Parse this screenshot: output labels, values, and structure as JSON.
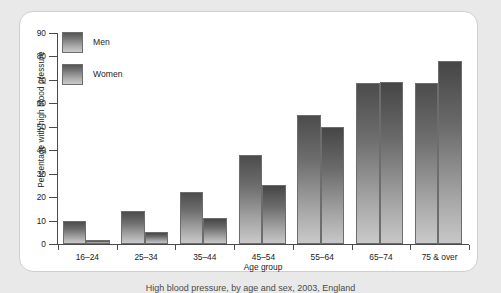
{
  "chart_data": {
    "type": "bar",
    "title": "",
    "xlabel": "Age group",
    "ylabel": "Percentage with high blood pressure",
    "categories": [
      "16–24",
      "25–34",
      "35–44",
      "45–54",
      "55–64",
      "65–74",
      "75 & over"
    ],
    "series": [
      {
        "name": "Men",
        "values": [
          10,
          14,
          22,
          38,
          55,
          68.5,
          68.5
        ]
      },
      {
        "name": "Women",
        "values": [
          1.5,
          5,
          11,
          25,
          50,
          69,
          78
        ]
      }
    ],
    "ylim": [
      0,
      90
    ],
    "yticks": [
      0,
      10,
      20,
      30,
      40,
      50,
      60,
      70,
      80,
      90
    ],
    "ytick_labels": [
      "0",
      "10",
      "20",
      "30",
      "40",
      "50",
      "60",
      "70",
      "80",
      "90"
    ],
    "grid": false,
    "legend_position": "top-left",
    "colors": {
      "men_bar_top": "#4c4c4c",
      "men_bar_bottom": "#c9c9c9",
      "women_bar_top": "#464646",
      "women_bar_bottom": "#c7c7c7",
      "bar_outline": "#6d6d6d",
      "axis": "#4a4a4a",
      "panel_background": "#ffffff",
      "page_background": "#e9e9e9"
    }
  },
  "legend": {
    "items": [
      {
        "label": "Men"
      },
      {
        "label": "Women"
      }
    ]
  },
  "caption": {
    "text": "High blood pressure, by age and sex, 2003, England"
  }
}
